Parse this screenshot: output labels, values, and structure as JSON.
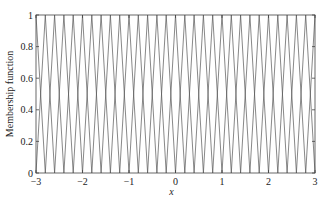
{
  "chart_data": {
    "type": "line",
    "title": "",
    "xlabel": "x",
    "ylabel": "Membership function",
    "xlim": [
      -3,
      3
    ],
    "ylim": [
      0,
      1
    ],
    "grid": false,
    "legend": "none",
    "xticks": [
      -3,
      -2,
      -1,
      0,
      1,
      2,
      3
    ],
    "xtick_labels": [
      "−3",
      "−2",
      "−1",
      "0",
      "1",
      "2",
      "3"
    ],
    "yticks": [
      0,
      0.2,
      0.4,
      0.6,
      0.8,
      1
    ],
    "ytick_labels": [
      "0",
      "0.2",
      "0.4",
      "0.6",
      "0.8",
      "1"
    ],
    "series_description": "31 overlapping triangular membership functions centered from -3 to 3 in steps of 0.2, each with peak 1 and half-width 0.2",
    "triangle_centers_start": -3,
    "triangle_centers_end": 3,
    "triangle_center_step": 0.2,
    "triangle_half_width": 0.2,
    "triangle_peak": 1,
    "line_color": "#555555",
    "axis_color": "#444444"
  }
}
